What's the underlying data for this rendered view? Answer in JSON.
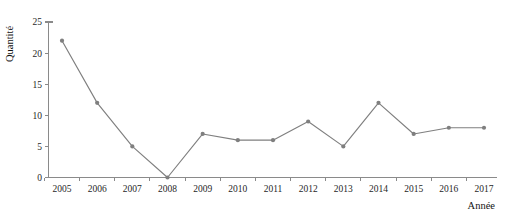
{
  "chart_data": {
    "type": "line",
    "title": "",
    "subtitle": "",
    "xlabel": "Année",
    "ylabel": "Quantité",
    "categories": [
      "2005",
      "2006",
      "2007",
      "2008",
      "2009",
      "2010",
      "2011",
      "2012",
      "2013",
      "2014",
      "2015",
      "2016",
      "2017"
    ],
    "values": [
      22,
      12,
      5,
      0,
      7,
      6,
      6,
      9,
      5,
      12,
      7,
      8,
      8
    ],
    "series": [
      {
        "name": "Quantité",
        "values": [
          22,
          12,
          5,
          0,
          7,
          6,
          6,
          9,
          5,
          12,
          7,
          8,
          8
        ]
      }
    ],
    "ylim": [
      0,
      25
    ],
    "yticks": [
      0,
      5,
      10,
      15,
      20,
      25
    ],
    "ytick_labels": [
      "0",
      "5",
      "10",
      "15",
      "20",
      "25"
    ],
    "xtick_labels": [
      "2005",
      "2006",
      "2007",
      "2008",
      "2009",
      "2010",
      "2011",
      "2012",
      "2013",
      "2014",
      "2015",
      "2016",
      "2017"
    ],
    "grid": false,
    "legend": false,
    "legend_position": "none",
    "marker": "circle",
    "colors": {
      "line": "#7f7f7f",
      "marker": "#7f7f7f",
      "axis": "#8a8a8a",
      "text": "#1f1f1f",
      "background": "#ffffff"
    },
    "annotations": []
  }
}
